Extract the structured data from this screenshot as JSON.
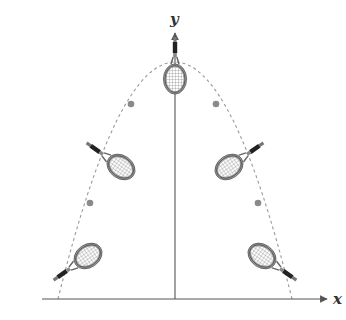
{
  "diagram": {
    "type": "parabolic trajectory of a tennis racket",
    "axes": {
      "x_label": "x",
      "y_label": "y",
      "origin": [
        175,
        299
      ],
      "x_axis": {
        "start": [
          42,
          299
        ],
        "end": [
          328,
          299
        ]
      },
      "y_axis": {
        "start": [
          175,
          299
        ],
        "end": [
          175,
          32
        ]
      }
    },
    "trajectory": {
      "style": "dashed",
      "apex": [
        175,
        62
      ],
      "left_base": [
        58,
        299
      ],
      "right_base": [
        292,
        299
      ],
      "color": "#9a9a9a"
    },
    "center_of_mass_dots": [
      {
        "x": 131,
        "y": 104
      },
      {
        "x": 216,
        "y": 104
      },
      {
        "x": 90,
        "y": 203
      },
      {
        "x": 258,
        "y": 203
      }
    ],
    "rackets": [
      {
        "id": "top",
        "head": [
          175,
          79
        ],
        "angle": 0
      },
      {
        "id": "upper-left",
        "head": [
          121,
          167
        ],
        "angle": -55
      },
      {
        "id": "upper-right",
        "head": [
          229,
          167
        ],
        "angle": 55
      },
      {
        "id": "lower-left",
        "head": [
          88,
          256
        ],
        "angle": -125
      },
      {
        "id": "lower-right",
        "head": [
          262,
          256
        ],
        "angle": 125
      }
    ],
    "colors": {
      "axis": "#555555",
      "dot": "#8a8a8a",
      "racket_frame": "#555555",
      "racket_frame_fill": "#9a9a9a",
      "handle": "#222222",
      "strings": "#7a7a7a"
    }
  }
}
